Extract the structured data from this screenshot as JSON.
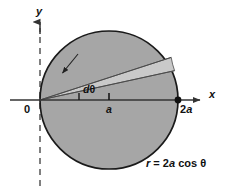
{
  "figure": {
    "background_color": "#ffffff",
    "width": 232,
    "height": 190
  },
  "axes": {
    "x_axis": {
      "label": "x",
      "name": "x-axis",
      "style": "solid",
      "arrow": "right",
      "color": "#333333",
      "y": 100,
      "x_start": 10,
      "x_end": 205
    },
    "y_axis": {
      "label": "y",
      "name": "y-axis",
      "style": "dashed",
      "arrow": "up",
      "color": "#555555",
      "x": 40,
      "y_start": 20,
      "y_end": 186
    },
    "origin_label": "0"
  },
  "circle": {
    "name": "polar-circle",
    "center_x": 109,
    "center_y": 100,
    "radius": 69,
    "fill_color": "#a6a6a6",
    "stroke_color": "#1a1a1a",
    "stroke_width": 1.6
  },
  "sector": {
    "name": "differential-sector",
    "label": "dθ",
    "fill_color": "#c9c9c9",
    "stroke_color": "#555555",
    "lower_ray_angle_deg": 18,
    "upper_ray_angle_deg": 25.5
  },
  "markers": [
    {
      "name": "tick-a",
      "label": "a",
      "x": 109,
      "y": 100,
      "type": "tick"
    },
    {
      "name": "point-2a",
      "label": "2a",
      "x": 178,
      "y": 100,
      "type": "dot",
      "color": "#111111"
    }
  ],
  "annotations": {
    "equation": "r = 2a cos θ",
    "equation_parts": {
      "r": "r",
      "equals": "=",
      "coefficient": "2",
      "a": "a",
      "trig": "cos",
      "theta": "θ"
    },
    "pointer_arrow": {
      "name": "sector-pointer-arrow",
      "from_x": 74,
      "from_y": 58,
      "to_x": 62,
      "to_y": 74
    }
  },
  "labels": {
    "y": "y",
    "x": "x",
    "zero": "0",
    "a": "a",
    "two_a_prefix": "2",
    "two_a_italic": "a",
    "d_italic": "d",
    "theta": "θ"
  }
}
